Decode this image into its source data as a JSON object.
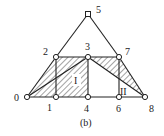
{
  "figure": {
    "caption": "(b)",
    "nodes": [
      {
        "id": "0",
        "label": "0",
        "x": 27,
        "y": 97
      },
      {
        "id": "1",
        "label": "1",
        "x": 56,
        "y": 97
      },
      {
        "id": "2",
        "label": "2",
        "x": 56,
        "y": 57
      },
      {
        "id": "3",
        "label": "3",
        "x": 88,
        "y": 57
      },
      {
        "id": "4",
        "label": "4",
        "x": 88,
        "y": 97
      },
      {
        "id": "5",
        "label": "5",
        "x": 88,
        "y": 14
      },
      {
        "id": "6",
        "label": "6",
        "x": 119,
        "y": 97
      },
      {
        "id": "7",
        "label": "7",
        "x": 119,
        "y": 57
      },
      {
        "id": "8",
        "label": "8",
        "x": 145,
        "y": 97
      }
    ],
    "regions": [
      {
        "label": "I"
      },
      {
        "label": "II"
      }
    ]
  }
}
